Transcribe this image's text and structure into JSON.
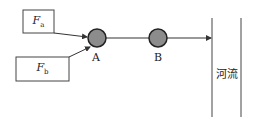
{
  "diagram": {
    "sources": [
      {
        "id": "Fa",
        "label": "F",
        "subscript": "a"
      },
      {
        "id": "Fb",
        "label": "F",
        "subscript": "b"
      }
    ],
    "nodes": [
      {
        "id": "A",
        "label": "A"
      },
      {
        "id": "B",
        "label": "B"
      }
    ],
    "river": {
      "label": "河流"
    },
    "edges": [
      {
        "from": "Fa",
        "to": "A"
      },
      {
        "from": "Fb",
        "to": "A"
      },
      {
        "from": "A",
        "to": "B"
      },
      {
        "from": "B",
        "to": "river"
      }
    ],
    "colors": {
      "node_fill": "#8c8c8c",
      "stroke": "#333333",
      "background": "#ffffff"
    }
  }
}
